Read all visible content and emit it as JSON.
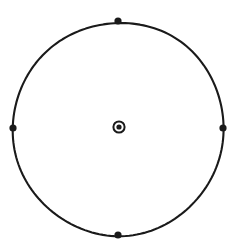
{
  "canvas": {
    "width": 238,
    "height": 249,
    "background_color": "#ffffff"
  },
  "figure": {
    "stroke_color": "#1a1a1a",
    "fill_color": "#1a1a1a"
  },
  "chart_data": {
    "type": "scatter",
    "title": "",
    "subtitle": "",
    "xlabel": "",
    "ylabel": "",
    "grid": false,
    "legend": false,
    "axes_visible": false,
    "tick_labels": [],
    "annotations": [],
    "shapes": [
      {
        "name": "main-circle",
        "kind": "circle",
        "cx": 118,
        "cy": 128,
        "r": 106,
        "stroke_width": 2.1,
        "stroke": "#1a1a1a",
        "fill": "none"
      },
      {
        "name": "center-marker-ring",
        "kind": "circle",
        "cx": 119,
        "cy": 127,
        "r": 5.6,
        "stroke_width": 2.0,
        "stroke": "#1a1a1a",
        "fill": "none"
      },
      {
        "name": "center-marker-dot",
        "kind": "circle",
        "cx": 119,
        "cy": 127,
        "r": 2.6,
        "stroke_width": 0,
        "stroke": "none",
        "fill": "#1a1a1a"
      }
    ],
    "points": [
      {
        "label": "north",
        "angle_deg": 90,
        "cx": 118,
        "cy": 21,
        "r": 3.6
      },
      {
        "label": "east",
        "angle_deg": 0,
        "cx": 223,
        "cy": 128,
        "r": 3.6
      },
      {
        "label": "south",
        "angle_deg": 270,
        "cx": 118,
        "cy": 235,
        "r": 3.6
      },
      {
        "label": "west",
        "angle_deg": 180,
        "cx": 13,
        "cy": 128,
        "r": 3.6
      }
    ]
  }
}
